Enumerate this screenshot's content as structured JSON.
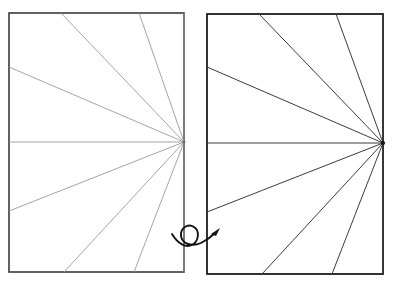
{
  "figure": {
    "title": "Fan of rays in two rectangular panels with a flip arrow",
    "background_color": "#ffffff",
    "width": 393,
    "height": 285
  },
  "chart_data": {
    "type": "line",
    "title": "Fan of rays in two rectangular panels with a flip arrow",
    "xlabel": "",
    "ylabel": "",
    "xlim": [
      0,
      393
    ],
    "ylim": [
      0,
      285
    ],
    "grid": false,
    "legend": "none",
    "annotations": [
      {
        "name": "flip-arrow",
        "kind": "curl-arrow",
        "meaning": "rotate / flip panel",
        "position": [
          196,
          238
        ],
        "direction": "counter-clockwise loop ending up-right"
      }
    ],
    "series": [
      {
        "name": "left-panel-frame",
        "kind": "rect",
        "x": 9,
        "y": 13,
        "width": 175,
        "height": 259,
        "stroke": "#3a3a3c",
        "stroke_width": 1.6,
        "fill": "#ffffff"
      },
      {
        "name": "left-panel-rays",
        "kind": "fan",
        "vertex": [
          184,
          142
        ],
        "stroke": "#9a9a9e",
        "stroke_width": 0.9,
        "endpoints": [
          [
            61,
            13
          ],
          [
            139,
            13
          ],
          [
            9,
            67
          ],
          [
            9,
            142
          ],
          [
            9,
            211
          ],
          [
            64,
            272
          ],
          [
            134,
            272
          ],
          [
            184,
            13
          ],
          [
            184,
            272
          ]
        ]
      },
      {
        "name": "right-panel-frame",
        "kind": "rect",
        "x": 207,
        "y": 14,
        "width": 176,
        "height": 260,
        "stroke": "#1d1d1f",
        "stroke_width": 1.8,
        "fill": "#ffffff"
      },
      {
        "name": "right-panel-rays",
        "kind": "fan",
        "vertex": [
          383,
          143
        ],
        "stroke": "#3c3c41",
        "stroke_width": 1.0,
        "endpoints": [
          [
            259,
            14
          ],
          [
            336,
            14
          ],
          [
            207,
            67
          ],
          [
            207,
            143
          ],
          [
            207,
            212
          ],
          [
            262,
            274
          ],
          [
            332,
            274
          ],
          [
            383,
            14
          ],
          [
            383,
            274
          ]
        ]
      }
    ],
    "colors": {
      "background": "#ffffff",
      "left_frame_stroke": "#3a3a3c",
      "left_ray_stroke": "#9a9a9e",
      "right_frame_stroke": "#1d1d1f",
      "right_ray_stroke": "#3c3c41",
      "arrow_stroke": "#111113"
    }
  }
}
